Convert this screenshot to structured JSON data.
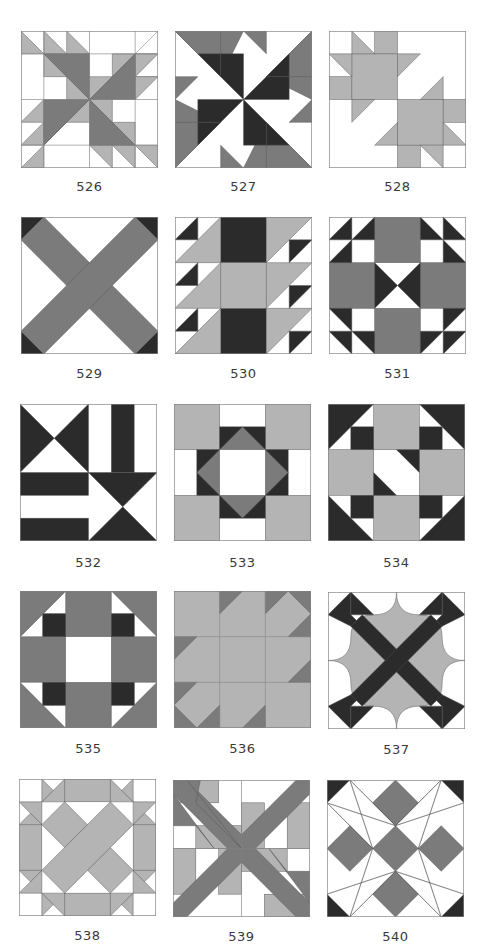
{
  "page": {
    "type": "quilt block catalog page"
  },
  "colors": {
    "light": "#b4b4b4",
    "medium": "#7b7b7b",
    "dark": "#2b2b2b",
    "background": "#ffffff"
  },
  "blocks": [
    {
      "number": "526"
    },
    {
      "number": "527"
    },
    {
      "number": "528"
    },
    {
      "number": "529"
    },
    {
      "number": "530"
    },
    {
      "number": "531"
    },
    {
      "number": "532"
    },
    {
      "number": "533"
    },
    {
      "number": "534"
    },
    {
      "number": "535"
    },
    {
      "number": "536"
    },
    {
      "number": "537"
    },
    {
      "number": "538"
    },
    {
      "number": "539"
    },
    {
      "number": "540"
    }
  ]
}
